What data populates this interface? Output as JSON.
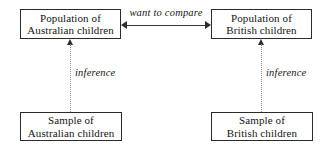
{
  "diagram": {
    "type": "flow-diagram",
    "nodes": [
      {
        "id": "population-australian",
        "label": "Population of\nAustralian children",
        "line1": "Population of",
        "line2": "Australian children",
        "position": "top-left"
      },
      {
        "id": "population-british",
        "label": "Population of\nBritish children",
        "line1": "Population of",
        "line2": "British children",
        "position": "top-right"
      },
      {
        "id": "sample-australian",
        "label": "Sample of\nAustralian children",
        "line1": "Sample of",
        "line2": "Australian children",
        "position": "bottom-left"
      },
      {
        "id": "sample-british",
        "label": "Sample of\nBritish children",
        "line1": "Sample of",
        "line2": "British children",
        "position": "bottom-right"
      }
    ],
    "connectors": [
      {
        "id": "compare",
        "label": "want to compare",
        "from": "population-australian",
        "to": "population-british",
        "style": "solid",
        "arrows": "both"
      },
      {
        "id": "inference-australian",
        "label": "inference",
        "from": "sample-australian",
        "to": "population-australian",
        "style": "dotted",
        "arrows": "up"
      },
      {
        "id": "inference-british",
        "label": "inference",
        "from": "sample-british",
        "to": "population-british",
        "style": "dotted",
        "arrows": "up"
      }
    ],
    "colors": {
      "box_border": "#2b2b2b",
      "text": "#151515",
      "solid_connector": "#3a3a3a",
      "dotted_connector": "#8a8a8a",
      "background": "#ffffff"
    }
  }
}
